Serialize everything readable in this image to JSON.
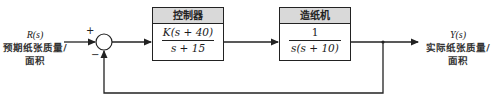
{
  "diagram": {
    "type": "closed-loop block diagram (unity negative feedback)",
    "input": {
      "symbol": "R(s)",
      "label_line1": "预期纸张质量/",
      "label_line2": "面积"
    },
    "summing_junction": {
      "plus_sign": "+",
      "minus_sign": "−"
    },
    "controller": {
      "title": "控制器",
      "numerator": "K(s + 40)",
      "denominator": "s + 15"
    },
    "plant": {
      "title": "造纸机",
      "numerator": "1",
      "denominator": "s(s + 10)"
    },
    "output": {
      "symbol": "Y(s)",
      "label_line1": "实际纸张质量/",
      "label_line2": "面积"
    },
    "colors": {
      "line": "#222222",
      "header_fill": "#d9d9d9"
    }
  }
}
